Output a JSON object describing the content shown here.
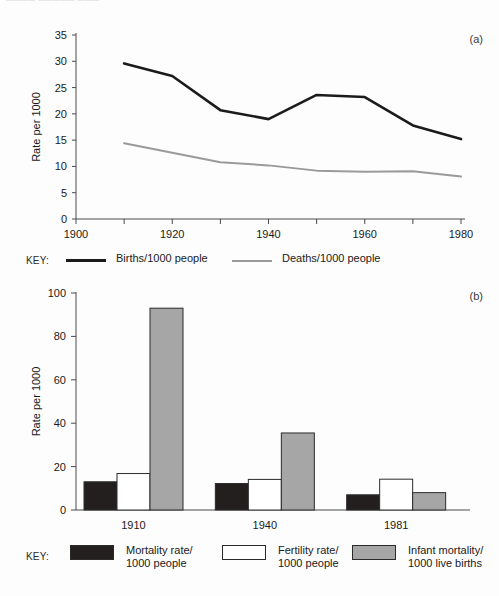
{
  "page": {
    "cutoff_header_text": "―――― ――――― ―――",
    "panel_a_label": "(a)",
    "panel_b_label": "(b)",
    "key_word": "KEY:"
  },
  "colors": {
    "births_line": "#1b1b1b",
    "deaths_line": "#9a9a9a",
    "bar_mortality": "#231f1f",
    "bar_fertility": "#ffffff",
    "bar_infant": "#a6a6a6",
    "axis": "#4a4a4a",
    "text": "#1a1a1a"
  },
  "chart_data": [
    {
      "type": "line",
      "panel": "(a)",
      "title": "",
      "xlabel": "",
      "ylabel": "Rate per 1000",
      "xlim": [
        1900,
        1980
      ],
      "ylim": [
        0,
        35
      ],
      "xticks": [
        1900,
        1910,
        1920,
        1930,
        1940,
        1950,
        1960,
        1970,
        1980
      ],
      "xticklabels": [
        "1900",
        "",
        "1920",
        "",
        "1940",
        "",
        "1960",
        "",
        "1980"
      ],
      "yticks": [
        0,
        5,
        10,
        15,
        20,
        25,
        30,
        35
      ],
      "yticklabels": [
        "0",
        "5",
        "10",
        "15",
        "20",
        "25",
        "30",
        "35"
      ],
      "grid": false,
      "legend_position": "below",
      "x": [
        1910,
        1920,
        1930,
        1940,
        1950,
        1960,
        1970,
        1980
      ],
      "series": [
        {
          "name": "Births/1000 people",
          "color": "#1b1b1b",
          "values": [
            29.6,
            27.2,
            20.7,
            19.0,
            23.6,
            23.2,
            17.8,
            15.2
          ]
        },
        {
          "name": "Deaths/1000 people",
          "color": "#9a9a9a",
          "values": [
            14.4,
            12.6,
            10.8,
            10.2,
            9.2,
            9.0,
            9.1,
            8.1
          ]
        }
      ]
    },
    {
      "type": "bar",
      "panel": "(b)",
      "title": "",
      "xlabel": "",
      "ylabel": "Rate per 1000",
      "ylim": [
        0,
        100
      ],
      "yticks": [
        0,
        20,
        40,
        60,
        80,
        100
      ],
      "yticklabels": [
        "0",
        "20",
        "40",
        "60",
        "80",
        "100"
      ],
      "categories": [
        "1910",
        "1940",
        "1981"
      ],
      "grid": false,
      "legend_position": "below",
      "series": [
        {
          "name": "Mortality rate/1000 people",
          "color": "#231f1f",
          "values": [
            13.0,
            12.2,
            7.0
          ]
        },
        {
          "name": "Fertility rate/1000 people",
          "color": "#ffffff",
          "values": [
            16.8,
            14.1,
            14.2
          ]
        },
        {
          "name": "Infant mortality/1000 live births",
          "color": "#a6a6a6",
          "values": [
            93.0,
            35.5,
            8.0
          ]
        }
      ]
    }
  ],
  "legend_a": {
    "items": [
      {
        "label": "Births/1000 people",
        "swatch": "line-dark"
      },
      {
        "label": "Deaths/1000 people",
        "swatch": "line-grey"
      }
    ]
  },
  "legend_b": {
    "items": [
      {
        "line1": "Mortality rate/",
        "line2": "1000 people",
        "swatch": "box-black"
      },
      {
        "line1": "Fertility rate/",
        "line2": "1000 people",
        "swatch": "box-white"
      },
      {
        "line1": "Infant mortality/",
        "line2": "1000 live births",
        "swatch": "box-grey"
      }
    ]
  }
}
